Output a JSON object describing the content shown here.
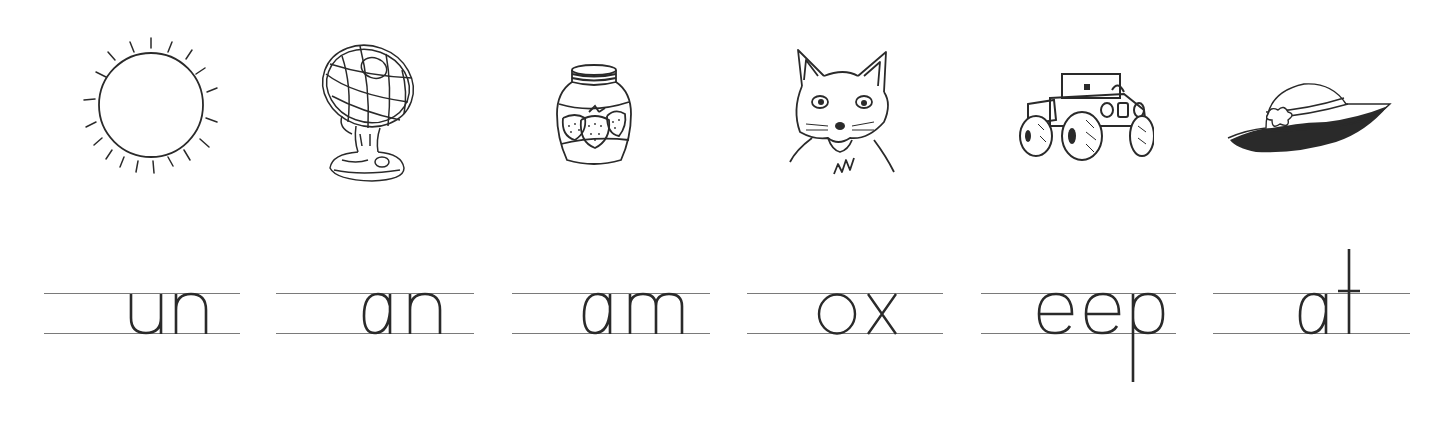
{
  "worksheet": {
    "instructions": "",
    "items": [
      {
        "picture": "sun-icon",
        "answer_word": "sun",
        "word_ending": "un"
      },
      {
        "picture": "fan-icon",
        "answer_word": "fan",
        "word_ending": "an"
      },
      {
        "picture": "jam-jar-icon",
        "answer_word": "jam",
        "word_ending": "am"
      },
      {
        "picture": "fox-icon",
        "answer_word": "fox",
        "word_ending": "ox"
      },
      {
        "picture": "jeep-icon",
        "answer_word": "jeep",
        "word_ending": "eep"
      },
      {
        "picture": "hat-icon",
        "answer_word": "hat",
        "word_ending": "at"
      }
    ]
  },
  "colors": {
    "ink": "#2a2a2a",
    "rule": "#7a7a7a",
    "background": "#ffffff"
  }
}
